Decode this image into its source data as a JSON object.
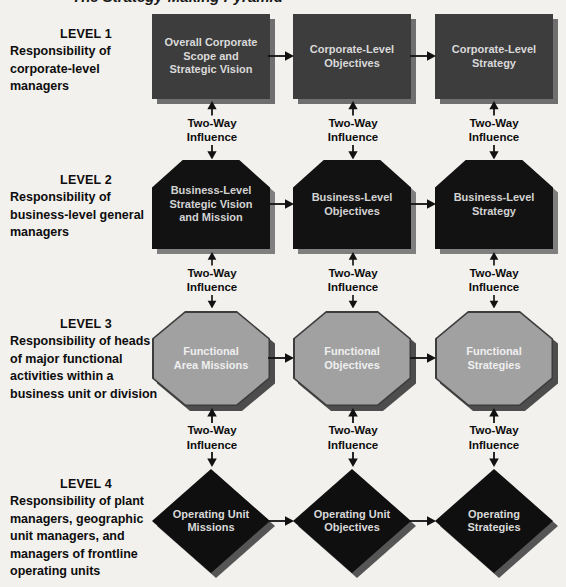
{
  "figure": {
    "clipped_title": "The Strategy-Making Pyramid"
  },
  "connector_label": {
    "line1": "Two-Way",
    "line2": "Influence"
  },
  "colors": {
    "arrow": "#111111",
    "label_text": "#0d0d0d",
    "background": "#f3f1ed"
  },
  "levels": [
    {
      "heading": "LEVEL 1",
      "description": "Responsibility of\ncorporate-level\nmanagers",
      "shape": "rectangle",
      "fill": "#3d3d3d",
      "shadow": "#6f6f6f",
      "text_color": "#d9d9d9",
      "nodes": [
        "Overall Corporate\nScope and\nStrategic Vision",
        "Corporate-Level\nObjectives",
        "Corporate-Level\nStrategy"
      ]
    },
    {
      "heading": "LEVEL 2",
      "description": "Responsibility of\nbusiness-level general\nmanagers",
      "shape": "chamfered-rectangle",
      "fill": "#121212",
      "shadow": "#7f7f7f",
      "text_color": "#d2d2d2",
      "nodes": [
        "Business-Level\nStrategic Vision\nand Mission",
        "Business-Level\nObjectives",
        "Business-Level\nStrategy"
      ]
    },
    {
      "heading": "LEVEL 3",
      "description": "Responsibility of heads\nof major functional\nactivities within a\nbusiness unit or division",
      "shape": "octagon",
      "fill": "#a1a1a1",
      "edge": "#3c3c3c",
      "shadow": "#4d4d4d",
      "text_color": "#efefef",
      "nodes": [
        "Functional\nArea Missions",
        "Functional\nObjectives",
        "Functional\nStrategies"
      ]
    },
    {
      "heading": "LEVEL 4",
      "description": "Responsibility of plant\nmanagers, geographic\nunit managers, and\nmanagers of frontline\noperating units",
      "shape": "diamond",
      "fill": "#0f0f0f",
      "shadow": "#555555",
      "text_color": "#d9d9d9",
      "nodes": [
        "Operating Unit\nMissions",
        "Operating Unit\nObjectives",
        "Operating\nStrategies"
      ]
    }
  ]
}
